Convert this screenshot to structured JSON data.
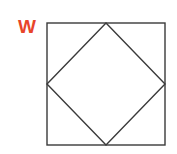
{
  "label": {
    "text": "W",
    "color": "#e8452a"
  },
  "figure": {
    "stroke_color": "#3a3a3a",
    "square": {
      "x": 47,
      "y": 23,
      "width": 118,
      "height": 122
    },
    "diamond": {
      "points": [
        [
          106,
          23
        ],
        [
          165,
          84
        ],
        [
          106,
          145
        ],
        [
          47,
          84
        ]
      ]
    }
  }
}
